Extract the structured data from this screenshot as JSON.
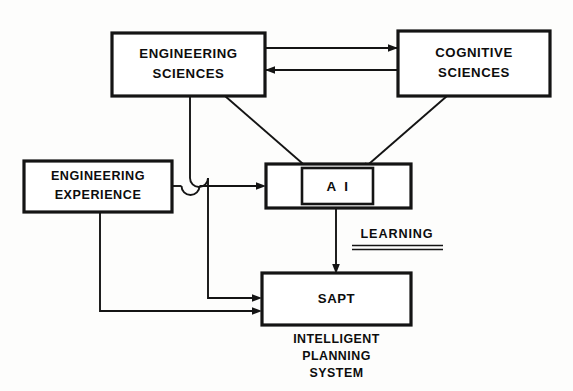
{
  "diagram": {
    "background_color": "#fdfdfc",
    "line_color": "#141414",
    "nodes": {
      "engineering_sciences": {
        "line1": "ENGINEERING",
        "line2": "SCIENCES"
      },
      "cognitive_sciences": {
        "line1": "COGNITIVE",
        "line2": "SCIENCES"
      },
      "engineering_experience": {
        "line1": "ENGINEERING",
        "line2": "EXPERIENCE"
      },
      "ai": {
        "label": "A I"
      },
      "sapt": {
        "label": "SAPT",
        "caption_line1": "INTELLIGENT",
        "caption_line2": "PLANNING",
        "caption_line3": "SYSTEM"
      }
    },
    "edges": {
      "learning_label": "LEARNING"
    }
  }
}
